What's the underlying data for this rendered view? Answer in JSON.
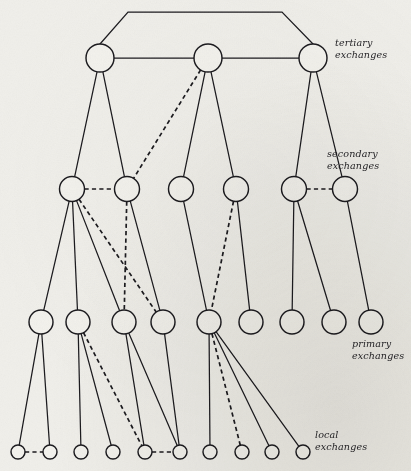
{
  "figure": {
    "name": "hierarchical-telephone-exchange-network",
    "background_color": "#f0efea",
    "ink_color": "#17161a",
    "width": 411,
    "height": 471
  },
  "labels": [
    {
      "id": "tertiary",
      "line1": "tertiary",
      "line2": "exchanges",
      "x": 335,
      "y": 46
    },
    {
      "id": "secondary",
      "line1": "secondary",
      "line2": "exchanges",
      "x": 327,
      "y": 157
    },
    {
      "id": "primary",
      "line1": "primary",
      "line2": "exchanges",
      "x": 352,
      "y": 347
    },
    {
      "id": "local",
      "line1": "local",
      "line2": "exchanges",
      "x": 315,
      "y": 438
    }
  ],
  "levels": [
    {
      "id": "tertiary",
      "label": "tertiary exchanges",
      "radius": 14,
      "y": 58,
      "nodes": [
        {
          "id": "t1",
          "x": 100,
          "y": 58
        },
        {
          "id": "t2",
          "x": 208,
          "y": 58
        },
        {
          "id": "t3",
          "x": 313,
          "y": 58
        }
      ]
    },
    {
      "id": "secondary",
      "label": "secondary exchanges",
      "radius": 12.5,
      "y": 189,
      "nodes": [
        {
          "id": "s1",
          "x": 72,
          "y": 189
        },
        {
          "id": "s2",
          "x": 127,
          "y": 189
        },
        {
          "id": "s3",
          "x": 181,
          "y": 189
        },
        {
          "id": "s4",
          "x": 236,
          "y": 189
        },
        {
          "id": "s5",
          "x": 294,
          "y": 189
        },
        {
          "id": "s6",
          "x": 345,
          "y": 189
        }
      ]
    },
    {
      "id": "primary",
      "label": "primary exchanges",
      "radius": 12,
      "y": 322,
      "nodes": [
        {
          "id": "p1",
          "x": 41,
          "y": 322
        },
        {
          "id": "p2",
          "x": 78,
          "y": 322
        },
        {
          "id": "p3",
          "x": 124,
          "y": 322
        },
        {
          "id": "p4",
          "x": 163,
          "y": 322
        },
        {
          "id": "p5",
          "x": 209,
          "y": 322
        },
        {
          "id": "p6",
          "x": 251,
          "y": 322
        },
        {
          "id": "p7",
          "x": 292,
          "y": 322
        },
        {
          "id": "p8",
          "x": 334,
          "y": 322
        },
        {
          "id": "p9",
          "x": 371,
          "y": 322
        }
      ]
    },
    {
      "id": "local",
      "label": "local exchanges",
      "radius": 7,
      "y": 452,
      "nodes": [
        {
          "id": "l1",
          "x": 18,
          "y": 452
        },
        {
          "id": "l2",
          "x": 50,
          "y": 452
        },
        {
          "id": "l3",
          "x": 81,
          "y": 452
        },
        {
          "id": "l4",
          "x": 113,
          "y": 452
        },
        {
          "id": "l5",
          "x": 145,
          "y": 452
        },
        {
          "id": "l6",
          "x": 180,
          "y": 452
        },
        {
          "id": "l7",
          "x": 210,
          "y": 452
        },
        {
          "id": "l8",
          "x": 242,
          "y": 452
        },
        {
          "id": "l9",
          "x": 272,
          "y": 452
        },
        {
          "id": "l10",
          "x": 303,
          "y": 452
        }
      ]
    }
  ],
  "edges": {
    "tertiary_ring": [
      {
        "from": "t1",
        "to": "t2",
        "style": "solid"
      },
      {
        "from": "t2",
        "to": "t3",
        "style": "solid"
      }
    ],
    "tertiary_bypass": {
      "from": "t1",
      "to": "t3",
      "style": "solid",
      "path": "M 100 44 L 128 12 L 282 12 L 313 44"
    },
    "tertiary_to_secondary": [
      {
        "from": "t1",
        "to": "s1",
        "style": "solid"
      },
      {
        "from": "t1",
        "to": "s2",
        "style": "solid"
      },
      {
        "from": "t2",
        "to": "s2",
        "style": "dashed"
      },
      {
        "from": "t2",
        "to": "s3",
        "style": "solid"
      },
      {
        "from": "t2",
        "to": "s4",
        "style": "solid"
      },
      {
        "from": "t3",
        "to": "s5",
        "style": "solid"
      },
      {
        "from": "t3",
        "to": "s6",
        "style": "solid"
      }
    ],
    "secondary_lateral": [
      {
        "from": "s1",
        "to": "s2",
        "style": "dashed"
      },
      {
        "from": "s5",
        "to": "s6",
        "style": "dashed"
      }
    ],
    "secondary_to_primary": [
      {
        "from": "s1",
        "to": "p1",
        "style": "solid"
      },
      {
        "from": "s1",
        "to": "p2",
        "style": "solid"
      },
      {
        "from": "s1",
        "to": "p3",
        "style": "solid"
      },
      {
        "from": "s1",
        "to": "p4",
        "style": "dashed"
      },
      {
        "from": "s2",
        "to": "p3",
        "style": "dashed"
      },
      {
        "from": "s2",
        "to": "p4",
        "style": "solid"
      },
      {
        "from": "s3",
        "to": "p5",
        "style": "solid"
      },
      {
        "from": "s4",
        "to": "p5",
        "style": "dashed"
      },
      {
        "from": "s4",
        "to": "p6",
        "style": "solid"
      },
      {
        "from": "s5",
        "to": "p7",
        "style": "solid"
      },
      {
        "from": "s5",
        "to": "p8",
        "style": "solid"
      },
      {
        "from": "s6",
        "to": "p9",
        "style": "solid"
      }
    ],
    "primary_to_local": [
      {
        "from": "p1",
        "to": "l1",
        "style": "solid"
      },
      {
        "from": "p1",
        "to": "l2",
        "style": "solid"
      },
      {
        "from": "p2",
        "to": "l3",
        "style": "solid"
      },
      {
        "from": "p2",
        "to": "l4",
        "style": "solid"
      },
      {
        "from": "p2",
        "to": "l5",
        "style": "dashed"
      },
      {
        "from": "p3",
        "to": "l5",
        "style": "solid"
      },
      {
        "from": "p3",
        "to": "l6",
        "style": "solid"
      },
      {
        "from": "p4",
        "to": "l6",
        "style": "solid"
      },
      {
        "from": "p5",
        "to": "l7",
        "style": "solid"
      },
      {
        "from": "p5",
        "to": "l8",
        "style": "dashed"
      },
      {
        "from": "p5",
        "to": "l9",
        "style": "solid"
      },
      {
        "from": "p5",
        "to": "l10",
        "style": "solid"
      }
    ],
    "local_lateral": [
      {
        "from": "l1",
        "to": "l2",
        "style": "dashed"
      },
      {
        "from": "l5",
        "to": "l6",
        "style": "dashed"
      }
    ]
  }
}
